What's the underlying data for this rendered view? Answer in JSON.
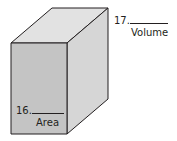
{
  "figure": {
    "shape": "rectangular prism",
    "colors": {
      "front_face": "#c4c4c4",
      "top_face": "#e2e2e2",
      "side_face": "#d6d6d6",
      "edge": "#231f20"
    }
  },
  "labels": {
    "q16": {
      "number": "16.",
      "caption": "Area"
    },
    "q17": {
      "number": "17.",
      "caption": "Volume"
    }
  }
}
